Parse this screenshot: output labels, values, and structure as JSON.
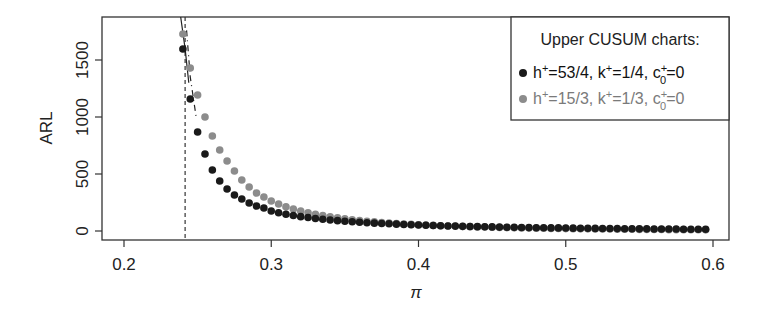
{
  "chart_data": {
    "type": "scatter",
    "title": "",
    "xlabel": "π",
    "ylabel": "ARL",
    "xlim": [
      0.185,
      0.61
    ],
    "ylim": [
      -80,
      1900
    ],
    "x_ticks": [
      0.2,
      0.3,
      0.4,
      0.5,
      0.6
    ],
    "x_tick_labels": [
      "0.2",
      "0.3",
      "0.4",
      "0.5",
      "0.6"
    ],
    "y_ticks": [
      0,
      500,
      1000,
      1500
    ],
    "y_tick_labels": [
      "0",
      "500",
      "1000",
      "1500"
    ],
    "grid": false,
    "legend_position": "top-right",
    "legend_title": "Upper CUSUM charts:",
    "vertical_reference_line": {
      "x": 0.2415,
      "style": "dashed"
    },
    "x": [
      0.24,
      0.245,
      0.25,
      0.255,
      0.26,
      0.265,
      0.27,
      0.275,
      0.28,
      0.285,
      0.29,
      0.295,
      0.3,
      0.305,
      0.31,
      0.315,
      0.32,
      0.325,
      0.33,
      0.335,
      0.34,
      0.345,
      0.35,
      0.355,
      0.36,
      0.365,
      0.37,
      0.375,
      0.38,
      0.385,
      0.39,
      0.395,
      0.4,
      0.405,
      0.41,
      0.415,
      0.42,
      0.425,
      0.43,
      0.435,
      0.44,
      0.445,
      0.45,
      0.455,
      0.46,
      0.465,
      0.47,
      0.475,
      0.48,
      0.485,
      0.49,
      0.495,
      0.5,
      0.505,
      0.51,
      0.515,
      0.52,
      0.525,
      0.53,
      0.535,
      0.54,
      0.545,
      0.55,
      0.555,
      0.56,
      0.565,
      0.57,
      0.575,
      0.58,
      0.585,
      0.59,
      0.595
    ],
    "series": [
      {
        "name": "h+=53/4, k+=1/4, c0+=0",
        "label_parts": {
          "h": "53/4",
          "k": "1/4",
          "c0": "0"
        },
        "color": "#1a1a1a",
        "values": [
          1596,
          1158,
          868,
          675,
          535,
          439,
          368,
          316,
          281,
          246,
          219,
          202,
          175,
          160,
          147,
          136,
          126,
          118,
          110,
          103,
          97,
          91,
          86,
          81,
          77,
          73,
          69,
          66,
          63,
          60,
          57,
          55,
          52,
          50,
          48,
          46,
          44,
          43,
          41,
          40,
          38,
          37,
          36,
          34,
          33,
          32,
          31,
          30,
          29,
          28,
          27,
          27,
          26,
          25,
          24,
          24,
          23,
          22,
          22,
          21,
          20,
          20,
          19,
          19,
          18,
          18,
          17,
          17,
          16,
          16,
          15,
          15
        ]
      },
      {
        "name": "h+=15/3, k+=1/3, c0+=0",
        "label_parts": {
          "h": "15/3",
          "k": "1/3",
          "c0": "0"
        },
        "color": "#8c8c8c",
        "values": [
          1728,
          1430,
          1193,
          1000,
          833,
          711,
          614,
          526,
          447,
          386,
          333,
          298,
          263,
          237,
          212,
          193,
          175,
          160,
          147,
          135,
          124,
          115,
          106,
          99,
          92,
          86,
          80,
          75,
          70,
          66,
          62,
          58,
          55,
          52,
          49,
          46,
          44,
          42,
          40,
          38,
          36,
          34,
          33,
          31,
          30,
          28,
          27,
          26,
          25,
          24,
          23,
          22,
          21,
          20,
          19,
          19,
          18,
          17,
          17,
          16,
          15,
          15,
          14,
          14,
          13,
          13,
          12,
          12,
          12,
          11,
          11,
          10
        ]
      }
    ],
    "overlay_lines": [
      {
        "style": "solid",
        "points": [
          [
            0.2385,
            1900
          ],
          [
            0.2415,
            1600
          ],
          [
            0.244,
            1300
          ]
        ]
      },
      {
        "style": "dashdot",
        "points": [
          [
            0.2425,
            1760
          ],
          [
            0.245,
            1350
          ],
          [
            0.249,
            1000
          ]
        ]
      }
    ]
  },
  "legend": {
    "title": "Upper CUSUM charts:",
    "entries": [
      {
        "h_label": "h",
        "h_value": "=53/4,",
        "k_label": "k",
        "k_value": "=1/4,",
        "c_label": "c",
        "c_value": "=0",
        "plus": "+",
        "sub": "0"
      },
      {
        "h_label": "h",
        "h_value": "=15/3,",
        "k_label": "k",
        "k_value": "=1/3,",
        "c_label": "c",
        "c_value": "=0",
        "plus": "+",
        "sub": "0"
      }
    ]
  },
  "axes": {
    "xlabel": "π",
    "ylabel": "ARL"
  }
}
